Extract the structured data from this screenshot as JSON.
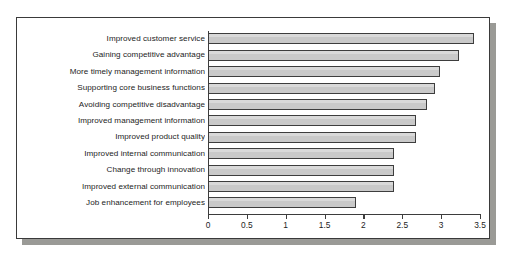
{
  "chart_data": {
    "type": "bar",
    "orientation": "horizontal",
    "title": "",
    "subtitle": "",
    "xlabel": "",
    "ylabel": "",
    "xlim": [
      0,
      3.5
    ],
    "grid": false,
    "legend": null,
    "xticks": [
      "0",
      "0.5",
      "1",
      "1.5",
      "2",
      "2.5",
      "3",
      "3.5"
    ],
    "xtick_values": [
      0,
      0.5,
      1,
      1.5,
      2,
      2.5,
      3,
      3.5
    ],
    "categories": [
      "Improved customer service",
      "Gaining competitive advantage",
      "More timely management information",
      "Supporting core business functions",
      "Avoiding competitive disadvantage",
      "Improved management information",
      "Improved product quality",
      "Improved internal communication",
      "Change through innovation",
      "Improved external communication",
      "Job enhancement for employees"
    ],
    "values": [
      3.42,
      3.23,
      2.99,
      2.92,
      2.82,
      2.68,
      2.68,
      2.39,
      2.39,
      2.39,
      1.91
    ]
  },
  "style": {
    "bar_fill": "#c9c9c9",
    "bar_border": "#3d3d3d",
    "axis_color": "#3d3d3d",
    "text_color": "#1c1c1c",
    "panel_background": "#ffffff",
    "panel_border": "#3a3a3a",
    "shadow_color": "#9a9a96",
    "page_background": "#ffffff"
  }
}
